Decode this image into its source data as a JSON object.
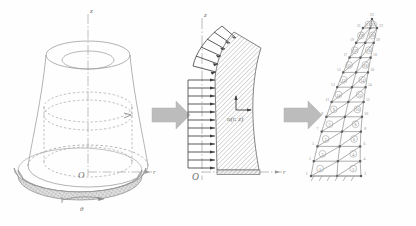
{
  "figure": {
    "background_color": "#fefefe",
    "line_color": "#8a8a8a",
    "dark_line_color": "#4a4a4a",
    "hatch_color": "#9a9a9a",
    "arrow_block_color": "#b9b9b9",
    "panels": [
      {
        "name": "three-dimensional-shell",
        "caption": "",
        "axes": [
          {
            "id": "z",
            "label": "z",
            "orientation": "vertical"
          },
          {
            "id": "r",
            "label": "r",
            "orientation": "horizontal"
          }
        ],
        "origin_label": "O",
        "rotation_label": "θ",
        "features": [
          "truncated cone outer surface",
          "inner dashed cylinder",
          "dashed base circle",
          "shaded annular flange at base",
          "curved theta direction arrow"
        ]
      },
      {
        "name": "meridian-cross-section",
        "caption": "",
        "axes": [
          {
            "id": "z",
            "label": "z",
            "orientation": "vertical"
          },
          {
            "id": "r",
            "label": "r",
            "orientation": "horizontal"
          }
        ],
        "origin_label": "O",
        "displacement_label": "u(r, z)",
        "load_arrow_count": 16,
        "features": [
          "hatched meridian band",
          "distributed pressure arrows on inner edge",
          "dash-dot axis of symmetry",
          "fixed hatched base support"
        ]
      },
      {
        "name": "finite-element-mesh",
        "caption": "",
        "element_numbers": [
          "1",
          "2",
          "3",
          "4",
          "5",
          "6",
          "7",
          "8",
          "9",
          "10",
          "11",
          "12",
          "13",
          "14",
          "15",
          "16",
          "17",
          "18",
          "19",
          "20",
          "21",
          "22",
          "23",
          "24",
          "25",
          "26",
          "27",
          "28"
        ],
        "node_numbers": [
          "1",
          "2",
          "3",
          "4",
          "5",
          "6",
          "7",
          "8",
          "9",
          "10",
          "11",
          "12",
          "13",
          "14",
          "15",
          "16",
          "17",
          "18",
          "19",
          "20",
          "21",
          "22",
          "23"
        ],
        "features": [
          "triangular element mesh",
          "circled element numbers",
          "numbered boundary nodes",
          "fixed base nodes"
        ]
      }
    ],
    "flow_arrows": [
      {
        "name": "arrow-1",
        "direction": "right"
      },
      {
        "name": "arrow-2",
        "direction": "right"
      }
    ]
  }
}
